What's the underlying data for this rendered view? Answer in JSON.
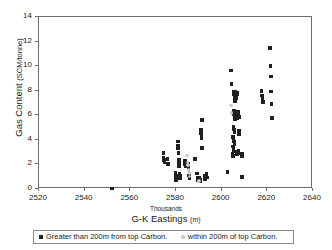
{
  "chart_data": {
    "type": "scatter",
    "title": "",
    "xlabel": "G-K Eastings",
    "xlabel_unit": "(m)",
    "x_sub_label": "Thousands",
    "ylabel": "Gas Content",
    "ylabel_unit": "(SCM/tonne)",
    "xlim": [
      2520,
      2640
    ],
    "ylim": [
      0,
      14
    ],
    "xticks": [
      2520,
      2540,
      2560,
      2580,
      2600,
      2620,
      2640
    ],
    "yticks": [
      0,
      2,
      4,
      6,
      8,
      10,
      12,
      14
    ],
    "grid": false,
    "legend_position": "bottom",
    "colors": {
      "far_marker": "#202020",
      "near_marker": "#d2d2d2",
      "axis": "#6d6d6d",
      "text": "#1a1a1a",
      "background": "#ffffff"
    },
    "series": [
      {
        "name": "Greater than 200m from top Carbon.",
        "marker": "filled-square",
        "color": "#202020",
        "points": [
          [
            2552.0,
            0.05
          ],
          [
            2574.5,
            2.95
          ],
          [
            2574.6,
            2.55
          ],
          [
            2574.7,
            2.35
          ],
          [
            2575.0,
            2.15
          ],
          [
            2576.3,
            2.45
          ],
          [
            2576.5,
            2.05
          ],
          [
            2579.8,
            1.35
          ],
          [
            2579.9,
            1.05
          ],
          [
            2580.0,
            0.85
          ],
          [
            2580.1,
            0.7
          ],
          [
            2580.8,
            3.85
          ],
          [
            2580.9,
            3.55
          ],
          [
            2581.0,
            3.3
          ],
          [
            2581.1,
            2.95
          ],
          [
            2581.2,
            2.35
          ],
          [
            2581.3,
            2.15
          ],
          [
            2581.4,
            1.85
          ],
          [
            2581.6,
            1.25
          ],
          [
            2581.7,
            1.05
          ],
          [
            2581.8,
            0.85
          ],
          [
            2583.9,
            2.3
          ],
          [
            2584.0,
            2.05
          ],
          [
            2584.1,
            1.85
          ],
          [
            2585.2,
            2.05
          ],
          [
            2585.4,
            1.75
          ],
          [
            2585.8,
            1.1
          ],
          [
            2586.0,
            0.9
          ],
          [
            2588.2,
            2.45
          ],
          [
            2589.3,
            1.25
          ],
          [
            2589.4,
            0.95
          ],
          [
            2589.5,
            0.75
          ],
          [
            2590.2,
            0.95
          ],
          [
            2590.4,
            0.75
          ],
          [
            2590.6,
            0.6
          ],
          [
            2590.9,
            4.85
          ],
          [
            2591.0,
            4.55
          ],
          [
            2591.1,
            4.35
          ],
          [
            2591.2,
            4.1
          ],
          [
            2591.4,
            3.35
          ],
          [
            2591.5,
            5.6
          ],
          [
            2592.6,
            1.05
          ],
          [
            2592.8,
            0.8
          ],
          [
            2593.4,
            1.2
          ],
          [
            2593.5,
            0.95
          ],
          [
            2602.6,
            1.4
          ],
          [
            2604.1,
            9.65
          ],
          [
            2604.3,
            8.55
          ],
          [
            2605.4,
            7.95
          ],
          [
            2605.5,
            7.7
          ],
          [
            2605.6,
            7.45
          ],
          [
            2605.8,
            7.15
          ],
          [
            2606.0,
            7.9
          ],
          [
            2606.2,
            7.75
          ],
          [
            2606.3,
            7.6
          ],
          [
            2606.5,
            7.4
          ],
          [
            2606.7,
            7.85
          ],
          [
            2606.9,
            7.7
          ],
          [
            2605.3,
            6.35
          ],
          [
            2605.5,
            6.1
          ],
          [
            2605.7,
            5.9
          ],
          [
            2605.9,
            5.7
          ],
          [
            2606.1,
            6.3
          ],
          [
            2606.4,
            6.15
          ],
          [
            2606.6,
            5.95
          ],
          [
            2606.8,
            5.75
          ],
          [
            2607.2,
            6.25
          ],
          [
            2607.4,
            6.05
          ],
          [
            2607.6,
            5.85
          ],
          [
            2605.2,
            5.05
          ],
          [
            2605.4,
            4.85
          ],
          [
            2605.6,
            4.65
          ],
          [
            2607.5,
            4.7
          ],
          [
            2607.7,
            4.45
          ],
          [
            2605.0,
            4.25
          ],
          [
            2605.2,
            4.05
          ],
          [
            2605.4,
            3.85
          ],
          [
            2605.6,
            3.65
          ],
          [
            2604.9,
            3.45
          ],
          [
            2605.1,
            3.25
          ],
          [
            2605.3,
            3.05
          ],
          [
            2604.8,
            2.85
          ],
          [
            2605.0,
            2.7
          ],
          [
            2606.6,
            3.05
          ],
          [
            2606.8,
            2.8
          ],
          [
            2607.4,
            3.15
          ],
          [
            2607.6,
            2.9
          ],
          [
            2608.8,
            2.9
          ],
          [
            2609.0,
            2.65
          ],
          [
            2608.9,
            1.0
          ],
          [
            2617.4,
            8.0
          ],
          [
            2617.6,
            7.6
          ],
          [
            2617.8,
            7.35
          ],
          [
            2618.0,
            7.1
          ],
          [
            2621.2,
            11.5
          ],
          [
            2621.4,
            10.0
          ],
          [
            2621.5,
            9.15
          ],
          [
            2621.6,
            7.95
          ],
          [
            2621.8,
            6.9
          ],
          [
            2622.0,
            5.8
          ]
        ]
      },
      {
        "name": "within 200m of top Carbon.",
        "marker": "open-circle",
        "color": "#d2d2d2",
        "points": [
          [
            2584.8,
            2.75
          ],
          [
            2585.0,
            2.15
          ],
          [
            2585.2,
            1.95
          ],
          [
            2585.6,
            1.55
          ],
          [
            2585.8,
            1.3
          ],
          [
            2586.0,
            1.0
          ],
          [
            2590.0,
            0.65
          ],
          [
            2604.0,
            6.8
          ],
          [
            2604.2,
            6.2
          ]
        ]
      }
    ]
  },
  "legend": {
    "entries": [
      {
        "label": "Greater than 200m from top Carbon.",
        "marker": "filled-square"
      },
      {
        "label": "within 200m of top Carbon.",
        "marker": "open-circle"
      }
    ]
  }
}
